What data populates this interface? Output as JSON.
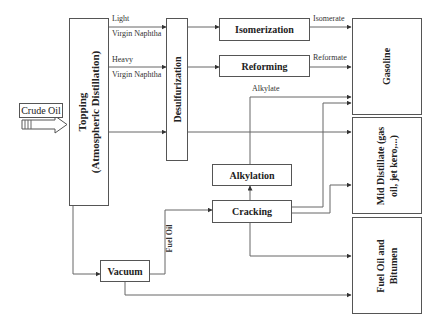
{
  "diagram": {
    "input": {
      "label": "Crude Oil"
    },
    "units": {
      "topping": {
        "line1": "Topping",
        "line2": "(Atmospheric Distillation)"
      },
      "desulfurization": {
        "label": "Desulfurization"
      },
      "isomerization": {
        "label": "Isomerization"
      },
      "reforming": {
        "label": "Reforming"
      },
      "alkylation": {
        "label": "Alkylation"
      },
      "cracking": {
        "label": "Cracking"
      },
      "vacuum": {
        "label": "Vacuum"
      }
    },
    "products": {
      "gasoline": {
        "line1": "Gasoline",
        "line2": ""
      },
      "mid_distillate": {
        "line1": "Mid Distillate (gas",
        "line2": "oil, jet kero,...)"
      },
      "fuel_oil": {
        "line1": "Fuel Oil  and",
        "line2": "Bitumen"
      }
    },
    "streams": {
      "light_top": "Light",
      "light_bottom": "Virgin Naphtha",
      "heavy_top": "Heavy",
      "heavy_bottom": "Virgin Naphtha",
      "isomerate": "Isomerate",
      "reformate": "Reformate",
      "alkylate": "Alkylate",
      "fuel_oil": "Fuel Oil"
    },
    "colors": {
      "line": "#555555",
      "text": "#222222",
      "background": "#ffffff"
    }
  }
}
